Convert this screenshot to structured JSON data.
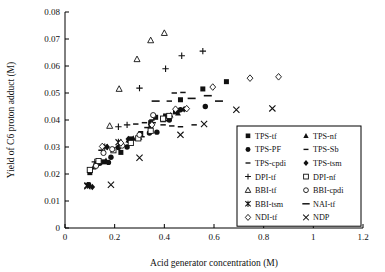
{
  "chart_data": {
    "type": "scatter",
    "title": "",
    "xlabel": "Acid generator concentration (M)",
    "ylabel": "Yield of C6 proton adduct (M)",
    "xlim": [
      0,
      1.2
    ],
    "ylim": [
      0,
      0.08
    ],
    "xticks": [
      "0",
      "0.2",
      "0.4",
      "0.6",
      "0.8",
      "1",
      "1.2"
    ],
    "xtick_values": [
      0,
      0.2,
      0.4,
      0.6,
      0.8,
      1,
      1.2
    ],
    "yticks": [
      "0",
      "0.01",
      "0.02",
      "0.03",
      "0.04",
      "0.05",
      "0.06",
      "0.07",
      "0.08"
    ],
    "ytick_values": [
      0,
      0.01,
      0.02,
      0.03,
      0.04,
      0.05,
      0.06,
      0.07,
      0.08
    ],
    "grid": false,
    "legend_position": "lower-right-inside",
    "series": [
      {
        "name": "TPS-tf",
        "marker": "filled-square",
        "points": [
          [
            0.1,
            0.0205
          ],
          [
            0.155,
            0.0245
          ],
          [
            0.225,
            0.028
          ],
          [
            0.265,
            0.033
          ],
          [
            0.305,
            0.035
          ],
          [
            0.345,
            0.039
          ],
          [
            0.365,
            0.041
          ],
          [
            0.405,
            0.0415
          ],
          [
            0.445,
            0.043
          ],
          [
            0.465,
            0.0475
          ],
          [
            0.555,
            0.0515
          ],
          [
            0.65,
            0.0542
          ]
        ]
      },
      {
        "name": "TPS-nf",
        "marker": "filled-triangle",
        "points": [
          [
            0.115,
            0.0225
          ],
          [
            0.165,
            0.025
          ],
          [
            0.255,
            0.0325
          ],
          [
            0.275,
            0.0332
          ],
          [
            0.3,
            0.0335
          ],
          [
            0.345,
            0.038
          ],
          [
            0.395,
            0.04
          ],
          [
            0.425,
            0.0418
          ],
          [
            0.455,
            0.0425
          ]
        ]
      },
      {
        "name": "TPS-PF",
        "marker": "filled-circle",
        "points": [
          [
            0.095,
            0.016
          ],
          [
            0.125,
            0.0235
          ],
          [
            0.14,
            0.024
          ],
          [
            0.175,
            0.0243
          ],
          [
            0.185,
            0.0262
          ],
          [
            0.215,
            0.0298
          ],
          [
            0.25,
            0.03
          ],
          [
            0.34,
            0.0352
          ],
          [
            0.37,
            0.0355
          ],
          [
            0.42,
            0.04
          ],
          [
            0.465,
            0.0438
          ],
          [
            0.565,
            0.045
          ]
        ]
      },
      {
        "name": "TPS-Sb",
        "marker": "dash-small",
        "points": [
          [
            0.145,
            0.0288
          ],
          [
            0.215,
            0.03
          ],
          [
            0.26,
            0.0318
          ],
          [
            0.31,
            0.0338
          ],
          [
            0.33,
            0.0372
          ],
          [
            0.355,
            0.039
          ],
          [
            0.395,
            0.0382
          ],
          [
            0.43,
            0.0378
          ],
          [
            0.465,
            0.0375
          ],
          [
            0.52,
            0.0382
          ]
        ]
      },
      {
        "name": "TPS-cpdi",
        "marker": "dash-small",
        "points": [
          [
            0.285,
            0.0385
          ],
          [
            0.32,
            0.039
          ],
          [
            0.35,
            0.04
          ],
          [
            0.4,
            0.0398
          ],
          [
            0.44,
            0.05
          ],
          [
            0.475,
            0.0502
          ],
          [
            0.42,
            0.047
          ]
        ]
      },
      {
        "name": "TPS-tsm",
        "marker": "filled-diamond",
        "points": [
          [
            0.11,
            0.0152
          ],
          [
            0.17,
            0.03
          ],
          [
            0.255,
            0.033
          ],
          [
            0.345,
            0.0382
          ],
          [
            0.395,
            0.0405
          ],
          [
            0.42,
            0.0412
          ],
          [
            0.455,
            0.0432
          ],
          [
            0.48,
            0.044
          ]
        ]
      },
      {
        "name": "DPI-tf",
        "marker": "plus",
        "points": [
          [
            0.12,
            0.0245
          ],
          [
            0.215,
            0.0375
          ],
          [
            0.25,
            0.0382
          ],
          [
            0.3,
            0.0518
          ],
          [
            0.405,
            0.059
          ],
          [
            0.47,
            0.0638
          ],
          [
            0.555,
            0.0655
          ]
        ]
      },
      {
        "name": "DPI-nf",
        "marker": "open-square",
        "points": [
          [
            0.1,
            0.0215
          ],
          [
            0.135,
            0.0248
          ],
          [
            0.195,
            0.0288
          ],
          [
            0.265,
            0.0315
          ],
          [
            0.295,
            0.0332
          ],
          [
            0.345,
            0.036
          ],
          [
            0.395,
            0.0405
          ],
          [
            0.42,
            0.0415
          ]
        ]
      },
      {
        "name": "BBI-tf",
        "marker": "open-triangle",
        "points": [
          [
            0.18,
            0.0378
          ],
          [
            0.218,
            0.0515
          ],
          [
            0.29,
            0.0625
          ],
          [
            0.345,
            0.0695
          ],
          [
            0.4,
            0.0722
          ]
        ]
      },
      {
        "name": "BBI-cpdi",
        "marker": "open-circle",
        "points": [
          [
            0.125,
            0.023
          ],
          [
            0.155,
            0.0278
          ],
          [
            0.19,
            0.0292
          ],
          [
            0.23,
            0.0305
          ],
          [
            0.3,
            0.0345
          ],
          [
            0.355,
            0.0418
          ]
        ]
      },
      {
        "name": "BBI-tsm",
        "marker": "sun-star",
        "points": [
          [
            0.09,
            0.0158
          ],
          [
            0.16,
            0.03
          ],
          [
            0.215,
            0.0318
          ]
        ]
      },
      {
        "name": "NAI-tf",
        "marker": "dash-long",
        "points": [
          [
            0.365,
            0.047
          ],
          [
            0.51,
            0.048
          ],
          [
            0.575,
            0.049
          ],
          [
            0.62,
            0.047
          ]
        ]
      },
      {
        "name": "NDI-tf",
        "marker": "open-diamond",
        "points": [
          [
            0.15,
            0.0302
          ],
          [
            0.225,
            0.0315
          ],
          [
            0.35,
            0.0382
          ],
          [
            0.445,
            0.044
          ],
          [
            0.49,
            0.0442
          ],
          [
            0.595,
            0.0522
          ],
          [
            0.745,
            0.0555
          ],
          [
            0.86,
            0.056
          ]
        ]
      },
      {
        "name": "NDP",
        "marker": "cross-x",
        "points": [
          [
            0.09,
            0.0155
          ],
          [
            0.185,
            0.016
          ],
          [
            0.3,
            0.026
          ],
          [
            0.465,
            0.0345
          ],
          [
            0.56,
            0.0385
          ],
          [
            0.69,
            0.0438
          ],
          [
            0.835,
            0.0443
          ]
        ]
      }
    ]
  },
  "legend": {
    "entries": [
      {
        "label": "TPS-tf",
        "marker": "filled-square"
      },
      {
        "label": "TPS-nf",
        "marker": "filled-triangle"
      },
      {
        "label": "TPS-PF",
        "marker": "filled-circle"
      },
      {
        "label": "TPS-Sb",
        "marker": "dash-small"
      },
      {
        "label": "TPS-cpdi",
        "marker": "dash-small"
      },
      {
        "label": "TPS-tsm",
        "marker": "filled-diamond"
      },
      {
        "label": "DPI-tf",
        "marker": "plus"
      },
      {
        "label": "DPI-nf",
        "marker": "open-square"
      },
      {
        "label": "BBI-tf",
        "marker": "open-triangle"
      },
      {
        "label": "BBI-cpdi",
        "marker": "open-circle"
      },
      {
        "label": "BBI-tsm",
        "marker": "sun-star"
      },
      {
        "label": "NAI-tf",
        "marker": "dash-long"
      },
      {
        "label": "NDI-tf",
        "marker": "open-diamond"
      },
      {
        "label": "NDP",
        "marker": "cross-x"
      }
    ]
  },
  "colors": {
    "ink": "#111111",
    "background": "#ffffff"
  }
}
